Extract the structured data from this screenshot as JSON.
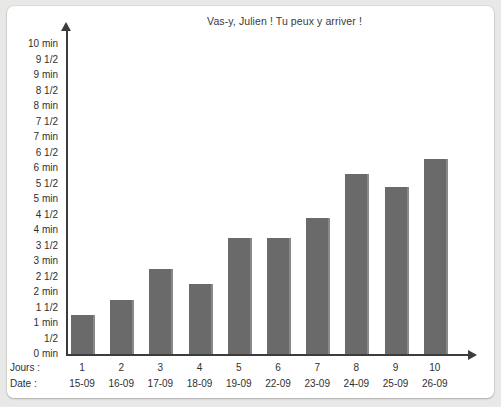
{
  "chart_data": {
    "type": "bar",
    "title": "Vas-y, Julien ! Tu peux y arriver !",
    "xlabel": "",
    "ylabel": "",
    "ylim": [
      0,
      10
    ],
    "grid": false,
    "legend": null,
    "unit": "min",
    "categories": [
      "1",
      "2",
      "3",
      "4",
      "5",
      "6",
      "7",
      "8",
      "9",
      "10"
    ],
    "values": [
      1.25,
      1.75,
      2.75,
      2.25,
      3.75,
      3.75,
      4.4,
      5.8,
      5.4,
      6.3
    ],
    "y_ticks": [
      "10 min",
      "9 1/2",
      "9 min",
      "8 1/2",
      "8 min",
      "7 1/2",
      "7 min",
      "6 1/2",
      "6 min",
      "5 1/2",
      "5 min",
      "4 1/2",
      "4 min",
      "3 1/2",
      "3 min",
      "2 1/2",
      "2 min",
      "1 1/2",
      "1 min",
      "1/2",
      "0 min"
    ],
    "y_tick_values": [
      10,
      9.5,
      9,
      8.5,
      8,
      7.5,
      7,
      6.5,
      6,
      5.5,
      5,
      4.5,
      4,
      3.5,
      3,
      2.5,
      2,
      1.5,
      1,
      0.5,
      0
    ],
    "row_headers": {
      "days": "Jours :",
      "dates": "Date :"
    },
    "dates": [
      "15-09",
      "16-09",
      "17-09",
      "18-09",
      "19-09",
      "22-09",
      "23-09",
      "24-09",
      "25-09",
      "26-09"
    ]
  },
  "colors": {
    "bar_fill": "#6a6a6a",
    "bar_shadow": "#3c3c3c",
    "axis": "#3c3c3c",
    "text": "#2f2f2f",
    "title_text": "#3a3a3a",
    "card_background": "#ffffff",
    "page_background": "#e8e8e6"
  }
}
